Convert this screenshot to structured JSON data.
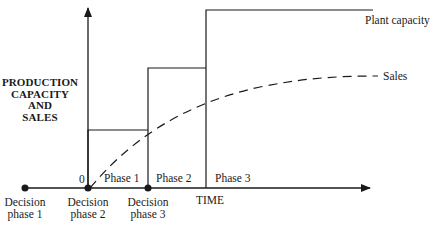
{
  "diagram": {
    "type": "phased-capacity-vs-sales",
    "y_axis_label": [
      "PRODUCTION",
      "CAPACITY",
      "AND",
      "SALES"
    ],
    "x_axis_label": "TIME",
    "origin_label": "0",
    "series": {
      "plant_capacity": {
        "label": "Plant capacity",
        "style": "solid step"
      },
      "sales": {
        "label": "Sales",
        "style": "dashed curve"
      }
    },
    "phases": [
      {
        "label": "Phase 1"
      },
      {
        "label": "Phase 2"
      },
      {
        "label": "Phase 3"
      }
    ],
    "decision_points": [
      {
        "line1": "Decision",
        "line2": "phase 1"
      },
      {
        "line1": "Decision",
        "line2": "phase 2"
      },
      {
        "line1": "Decision",
        "line2": "phase 3"
      }
    ],
    "colors": {
      "ink": "#1a1a1a",
      "background": "#ffffff"
    }
  }
}
